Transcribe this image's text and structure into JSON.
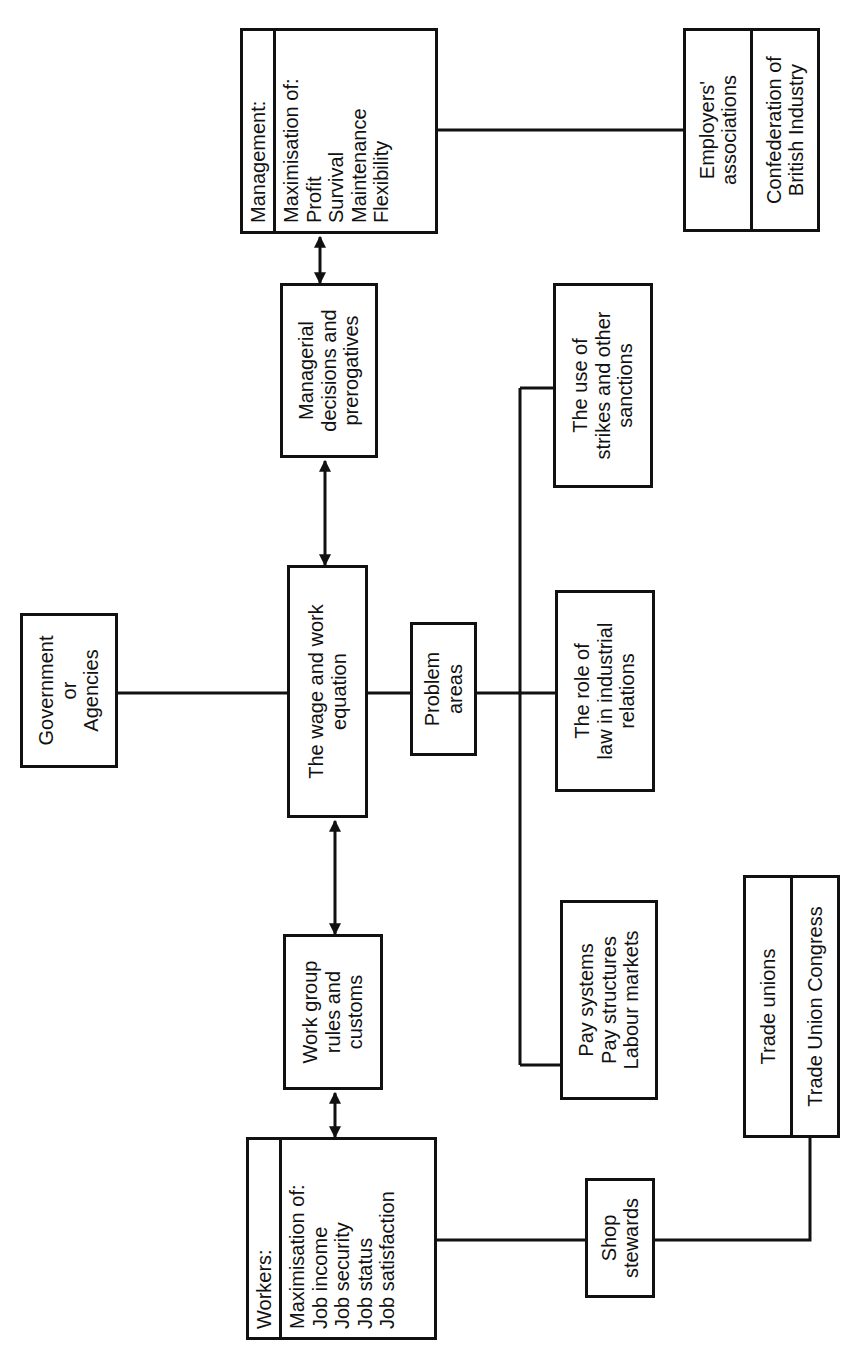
{
  "diagram": {
    "workers": {
      "title": "Workers:",
      "lines": [
        "Maximisation of:",
        "Job income",
        "Job security",
        "Job status",
        "Job satisfaction"
      ]
    },
    "work_group": {
      "lines": [
        "Work group",
        "rules and",
        "customs"
      ]
    },
    "wage_work": {
      "lines": [
        "The wage and work",
        "equation"
      ]
    },
    "managerial": {
      "lines": [
        "Managerial",
        "decisions and",
        "prerogatives"
      ]
    },
    "management": {
      "title": "Management:",
      "lines": [
        "Maximisation of:",
        "Profit",
        "Survival",
        "Maintenance",
        "Flexibility"
      ]
    },
    "government": {
      "lines": [
        "Government",
        "or",
        "Agencies"
      ]
    },
    "problem_areas": {
      "lines": [
        "Problem",
        "areas"
      ]
    },
    "pay": {
      "lines": [
        "Pay systems",
        "Pay structures",
        "Labour markets"
      ]
    },
    "law": {
      "lines": [
        "The role of",
        "law in industrial",
        "relations"
      ]
    },
    "strikes": {
      "lines": [
        "The use of",
        "strikes and other",
        "sanctions"
      ]
    },
    "shop_stewards": {
      "lines": [
        "Shop",
        "stewards"
      ]
    },
    "trade_unions": {
      "top": [
        "Trade unions"
      ],
      "bottom": [
        "Trade Union Congress"
      ]
    },
    "employers": {
      "top": [
        "Employers'",
        "associations"
      ],
      "bottom": [
        "Confederation of",
        "British Industry"
      ]
    },
    "connections": [
      {
        "from": "workers",
        "to": "work_group",
        "type": "bidirectional-arrow"
      },
      {
        "from": "work_group",
        "to": "wage_work",
        "type": "bidirectional-arrow"
      },
      {
        "from": "wage_work",
        "to": "managerial",
        "type": "bidirectional-arrow"
      },
      {
        "from": "managerial",
        "to": "management",
        "type": "bidirectional-arrow"
      },
      {
        "from": "government",
        "to": "wage_work",
        "type": "line"
      },
      {
        "from": "wage_work",
        "to": "problem_areas",
        "type": "line"
      },
      {
        "from": "problem_areas",
        "to": "pay",
        "type": "line"
      },
      {
        "from": "problem_areas",
        "to": "law",
        "type": "line"
      },
      {
        "from": "problem_areas",
        "to": "strikes",
        "type": "line"
      },
      {
        "from": "workers",
        "to": "shop_stewards",
        "type": "line"
      },
      {
        "from": "shop_stewards",
        "to": "trade_unions",
        "type": "line"
      },
      {
        "from": "management",
        "to": "employers",
        "type": "line"
      }
    ]
  }
}
